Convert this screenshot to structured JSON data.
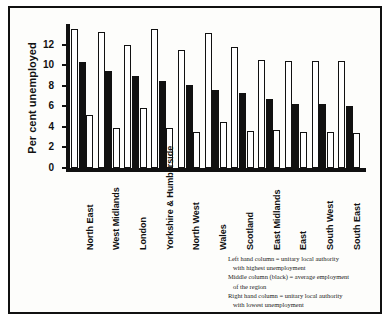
{
  "chart_data": {
    "type": "bar",
    "title": "",
    "xlabel": "",
    "ylabel": "Per cent unemployed",
    "ylim": [
      0,
      14
    ],
    "yticks": [
      0,
      2,
      4,
      6,
      8,
      10,
      12
    ],
    "grid": false,
    "legend_position": "bottom-right",
    "categories": [
      "North East",
      "West Midlands",
      "London",
      "Yorkshire & Humberside",
      "North West",
      "Wales",
      "Scotland",
      "East Midlands",
      "East",
      "South West",
      "South East"
    ],
    "series": [
      {
        "name": "Left hand column = unitary local authority with highest unemployment",
        "key": "highest",
        "fill": "#ffffff",
        "values": [
          13.5,
          13.2,
          12.0,
          13.5,
          11.5,
          13.1,
          11.8,
          10.5,
          10.4,
          10.4,
          10.4
        ]
      },
      {
        "name": "Middle column (black) = average employment of the region",
        "key": "average",
        "fill": "#111111",
        "values": [
          10.3,
          9.4,
          8.9,
          8.5,
          8.1,
          7.6,
          7.3,
          6.7,
          6.2,
          6.2,
          6.0
        ]
      },
      {
        "name": "Right hand column = unitary local authority with lowest unemployment",
        "key": "lowest",
        "fill": "#ffffff",
        "values": [
          5.2,
          3.9,
          5.8,
          3.9,
          3.5,
          4.5,
          3.6,
          3.7,
          3.5,
          3.5,
          3.4
        ]
      }
    ]
  },
  "legend": {
    "line1_a": "Left hand column = unitary local authority",
    "line1_b": "with highest unemployment",
    "line2_a": "Middle column (black) = average employment",
    "line2_b": "of the region",
    "line3_a": "Right hand column = unitary local authority",
    "line3_b": "with lowest unemployment"
  }
}
